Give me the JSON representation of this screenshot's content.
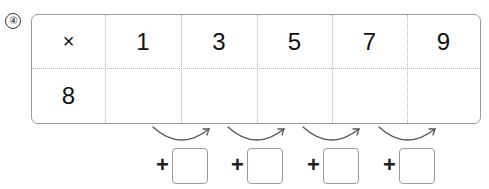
{
  "problem_number": "④",
  "table": {
    "header_row": [
      "×",
      "1",
      "3",
      "5",
      "7",
      "9"
    ],
    "row": [
      "8",
      "",
      "",
      "",
      "",
      ""
    ]
  },
  "steps": [
    {
      "operator": "+",
      "value": ""
    },
    {
      "operator": "+",
      "value": ""
    },
    {
      "operator": "+",
      "value": ""
    },
    {
      "operator": "+",
      "value": ""
    }
  ],
  "colors": {
    "border": "#9a9a9a",
    "gridline": "#b5b5b5",
    "arrow": "#555555",
    "text": "#111111"
  }
}
